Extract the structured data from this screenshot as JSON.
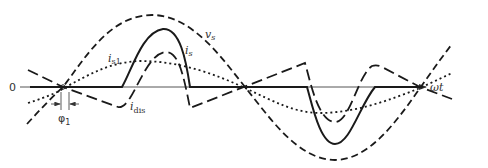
{
  "diagram": {
    "type": "waveform",
    "axis": {
      "origin_label": "0",
      "x_label": "ωt"
    },
    "curves": [
      {
        "id": "vs",
        "label_main": "v",
        "label_sub": "s",
        "style": "dashed",
        "meaning": "source voltage (sinusoid)"
      },
      {
        "id": "is",
        "label_main": "i",
        "label_sub": "s",
        "style": "solid",
        "meaning": "source current"
      },
      {
        "id": "is1",
        "label_main": "i",
        "label_sub": "s1",
        "style": "dotted",
        "meaning": "fundamental of source current"
      },
      {
        "id": "idis",
        "label_main": "i",
        "label_sub": "dis",
        "style": "long-dashed",
        "meaning": "distortion current"
      }
    ],
    "angle_marker": {
      "label_main": "φ",
      "label_sub": "1"
    }
  },
  "colors": {
    "ink": "#1a1a1a",
    "axis": "#333333",
    "background": "#ffffff"
  }
}
